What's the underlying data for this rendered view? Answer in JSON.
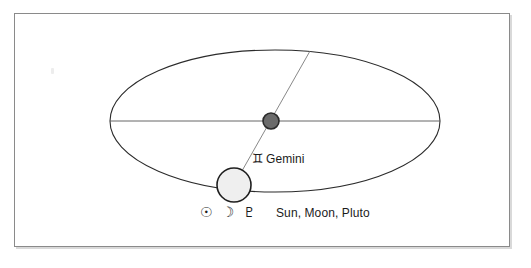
{
  "figure": {
    "type": "orbital-diagram",
    "title_visible": false,
    "background_color": "#ffffff",
    "frame": {
      "border_color": "#8a8a8a",
      "shadow_color": "#d9d9d9"
    }
  },
  "geometry": {
    "ellipse": {
      "name": "orbit-ellipse",
      "cx": 275,
      "cy": 121,
      "rx": 165,
      "ry": 71,
      "stroke": "#2b2b2b",
      "stroke_width": 1.1,
      "fill": "none"
    },
    "major_axis_line": {
      "name": "major-axis",
      "x1": 110,
      "y1": 121,
      "x2": 440,
      "y2": 121,
      "stroke": "#555555",
      "stroke_width": 0.9
    },
    "diagonal_line": {
      "name": "aspect-line",
      "x1": 310,
      "y1": 51,
      "x2": 234,
      "y2": 185,
      "stroke": "#7a7a7a",
      "stroke_width": 0.9
    },
    "center_dot": {
      "name": "center-body",
      "cx": 271,
      "cy": 121,
      "r": 8,
      "fill": "#6b6b6b",
      "stroke": "#2b2b2b",
      "stroke_width": 1.6
    },
    "orbiting_circle": {
      "name": "orbiting-body",
      "cx": 234,
      "cy": 185,
      "r": 17,
      "fill": "#efefef",
      "stroke": "#1f1f1f",
      "stroke_width": 1.6
    }
  },
  "annotations": {
    "sign": {
      "glyph": "♊",
      "glyph_name": "gemini-symbol",
      "label": "Gemini"
    },
    "bodies": {
      "glyphs": [
        {
          "glyph": "☉",
          "name": "sun-symbol"
        },
        {
          "glyph": "☽",
          "name": "moon-symbol"
        },
        {
          "glyph": "♇",
          "name": "pluto-symbol"
        }
      ],
      "label": "Sun, Moon, Pluto"
    }
  }
}
